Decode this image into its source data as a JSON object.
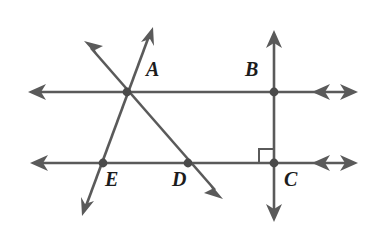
{
  "figure": {
    "kind": "geometry-diagram",
    "width": 373,
    "height": 235,
    "background_color": "#ffffff",
    "stroke_color": "#5a5a5a",
    "label_color": "#1c1c1c",
    "stroke_width": 2.6
  },
  "labels": {
    "a": "A",
    "b": "B",
    "c": "C",
    "d": "D",
    "e": "E"
  },
  "label_positions": {
    "a": {
      "x": 146,
      "y": 59
    },
    "b": {
      "x": 245,
      "y": 59
    },
    "c": {
      "x": 284,
      "y": 169
    },
    "d": {
      "x": 172,
      "y": 169
    },
    "e": {
      "x": 105,
      "y": 169
    }
  },
  "points": [
    {
      "name": "A",
      "x": 127,
      "y": 92,
      "dot": true
    },
    {
      "name": "B",
      "x": 274,
      "y": 92,
      "dot": true
    },
    {
      "name": "C",
      "x": 274,
      "y": 163,
      "dot": true
    },
    {
      "name": "D",
      "x": 188,
      "y": 163,
      "dot": true
    },
    {
      "name": "E",
      "x": 103,
      "y": 163,
      "dot": true
    }
  ],
  "lines": [
    {
      "name": "upper-horizontal-line",
      "x1": 28,
      "y1": 92,
      "x2": 358,
      "y2": 92,
      "arrow_start": "single",
      "arrow_end": "double"
    },
    {
      "name": "lower-horizontal-line",
      "x1": 30,
      "y1": 163,
      "x2": 358,
      "y2": 163,
      "arrow_start": "single",
      "arrow_end": "double"
    },
    {
      "name": "vertical-line-bc",
      "x1": 274,
      "y1": 30,
      "x2": 274,
      "y2": 222,
      "arrow_start": "single",
      "arrow_end": "single"
    },
    {
      "name": "transversal-line-ae",
      "x1": 152,
      "y1": 28,
      "x2": 83,
      "y2": 215,
      "arrow_start": "single",
      "arrow_end": "single"
    },
    {
      "name": "transversal-line-ad",
      "x1": 85,
      "y1": 42,
      "x2": 222,
      "y2": 198,
      "arrow_start": "single",
      "arrow_end": "single"
    }
  ],
  "right_angle_marker": {
    "name": "right-angle-at-c",
    "corner_x": 274,
    "corner_y": 163,
    "size": 14,
    "direction": "upper-left"
  }
}
